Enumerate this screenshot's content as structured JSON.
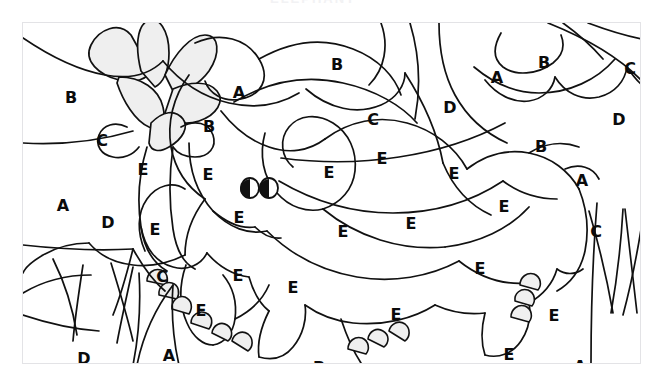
{
  "page": {
    "kind": "color-by-letter-coloring-page",
    "ghost_top_text": "ELEPHANT",
    "background_color": "#ffffff",
    "frame_color": "#e3e3e6",
    "ink_color": "#111111",
    "fill_color": "#efefef",
    "letter_color": "#0b0b0b"
  },
  "legend_letters": [
    "A",
    "B",
    "C",
    "D",
    "E"
  ],
  "labels": [
    {
      "t": "B",
      "x": 48,
      "y": 75
    },
    {
      "t": "B",
      "x": 314,
      "y": 42
    },
    {
      "t": "A",
      "x": 216,
      "y": 70
    },
    {
      "t": "A",
      "x": 474,
      "y": 55
    },
    {
      "t": "B",
      "x": 521,
      "y": 40
    },
    {
      "t": "C",
      "x": 607,
      "y": 46
    },
    {
      "t": "C",
      "x": 79,
      "y": 118
    },
    {
      "t": "B",
      "x": 186,
      "y": 104
    },
    {
      "t": "C",
      "x": 350,
      "y": 97
    },
    {
      "t": "D",
      "x": 427,
      "y": 85
    },
    {
      "t": "D",
      "x": 596,
      "y": 97
    },
    {
      "t": "E",
      "x": 120,
      "y": 147
    },
    {
      "t": "E",
      "x": 185,
      "y": 152
    },
    {
      "t": "E",
      "x": 306,
      "y": 150
    },
    {
      "t": "E",
      "x": 359,
      "y": 136
    },
    {
      "t": "E",
      "x": 431,
      "y": 151
    },
    {
      "t": "B",
      "x": 518,
      "y": 124
    },
    {
      "t": "A",
      "x": 559,
      "y": 158
    },
    {
      "t": "A",
      "x": 40,
      "y": 183
    },
    {
      "t": "D",
      "x": 85,
      "y": 200
    },
    {
      "t": "E",
      "x": 132,
      "y": 207
    },
    {
      "t": "E",
      "x": 216,
      "y": 195
    },
    {
      "t": "E",
      "x": 320,
      "y": 209
    },
    {
      "t": "E",
      "x": 388,
      "y": 201
    },
    {
      "t": "E",
      "x": 481,
      "y": 184
    },
    {
      "t": "C",
      "x": 573,
      "y": 209
    },
    {
      "t": "B",
      "x": 626,
      "y": 221
    },
    {
      "t": "C",
      "x": 139,
      "y": 254
    },
    {
      "t": "E",
      "x": 215,
      "y": 253
    },
    {
      "t": "E",
      "x": 270,
      "y": 265
    },
    {
      "t": "E",
      "x": 457,
      "y": 246
    },
    {
      "t": "E",
      "x": 178,
      "y": 288
    },
    {
      "t": "E",
      "x": 373,
      "y": 292
    },
    {
      "t": "E",
      "x": 531,
      "y": 293
    },
    {
      "t": "D",
      "x": 61,
      "y": 336
    },
    {
      "t": "A",
      "x": 146,
      "y": 333
    },
    {
      "t": "B",
      "x": 296,
      "y": 345
    },
    {
      "t": "C",
      "x": 417,
      "y": 347
    },
    {
      "t": "E",
      "x": 486,
      "y": 332
    },
    {
      "t": "A",
      "x": 557,
      "y": 344
    },
    {
      "t": "D",
      "x": 616,
      "y": 351
    }
  ]
}
